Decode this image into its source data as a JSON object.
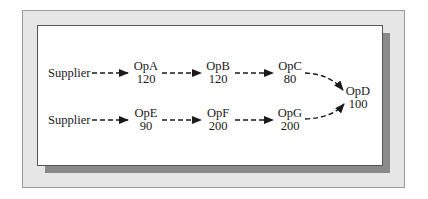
{
  "diagram": {
    "type": "flow",
    "rows": [
      {
        "source": "Supplier",
        "nodes": [
          {
            "name": "OpA",
            "value": "120"
          },
          {
            "name": "OpB",
            "value": "120"
          },
          {
            "name": "OpC",
            "value": "80"
          }
        ]
      },
      {
        "source": "Supplier",
        "nodes": [
          {
            "name": "OpE",
            "value": "90"
          },
          {
            "name": "OpF",
            "value": "200"
          },
          {
            "name": "OpG",
            "value": "200"
          }
        ]
      }
    ],
    "sink": {
      "name": "OpD",
      "value": "100"
    },
    "edges": [
      [
        "Supplier",
        "OpA"
      ],
      [
        "OpA",
        "OpB"
      ],
      [
        "OpB",
        "OpC"
      ],
      [
        "OpC",
        "OpD"
      ],
      [
        "Supplier",
        "OpE"
      ],
      [
        "OpE",
        "OpF"
      ],
      [
        "OpF",
        "OpG"
      ],
      [
        "OpG",
        "OpD"
      ]
    ],
    "edge_style": "dashed-arrow",
    "colors": {
      "frame_bg": "#e6e6e6",
      "frame_border": "#9a9a9a",
      "panel_bg": "#ffffff",
      "shadow": "#8a8a8a",
      "ink": "#1a1a1a"
    }
  }
}
